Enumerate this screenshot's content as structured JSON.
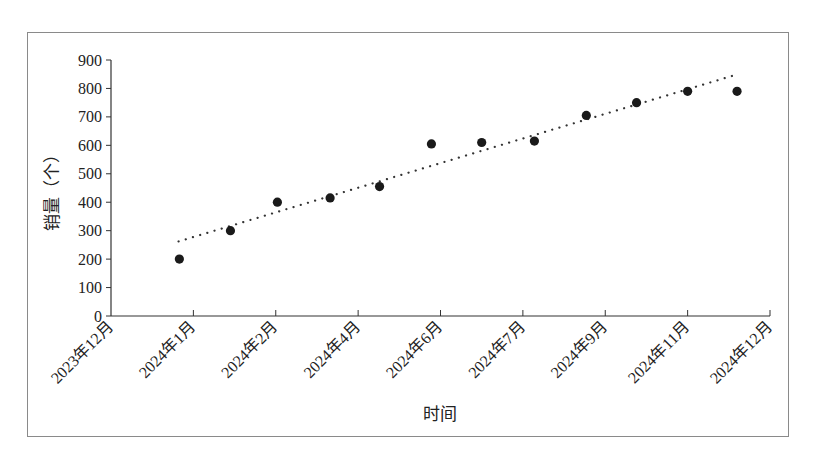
{
  "chart_data": {
    "type": "scatter",
    "title": "",
    "xlabel": "时间",
    "ylabel": "销量（个）",
    "ylim": [
      0,
      900
    ],
    "y_ticks": [
      0,
      100,
      200,
      300,
      400,
      500,
      600,
      700,
      800,
      900
    ],
    "x_tick_labels": [
      "2023年12月",
      "2024年1月",
      "2024年2月",
      "2024年4月",
      "2024年6月",
      "2024年7月",
      "2024年9月",
      "2024年11月",
      "2024年12月"
    ],
    "grid": false,
    "legend": null,
    "series": [
      {
        "name": "销量",
        "marker": "circle",
        "color": "#1a1a1a",
        "x_positions": [
          0.83,
          1.45,
          2.02,
          2.66,
          3.26,
          3.89,
          4.5,
          5.14,
          5.77,
          6.38,
          7.0,
          7.6
        ],
        "values": [
          200,
          300,
          400,
          415,
          455,
          605,
          610,
          615,
          705,
          750,
          790,
          790
        ]
      },
      {
        "name": "趋势线",
        "type": "line",
        "style": "dotted",
        "color": "#333333",
        "x_positions": [
          0.82,
          7.61
        ],
        "values": [
          262,
          850
        ]
      }
    ]
  },
  "layout": {
    "plot_left": 111,
    "plot_right": 770,
    "plot_top": 60,
    "plot_bottom": 316
  }
}
